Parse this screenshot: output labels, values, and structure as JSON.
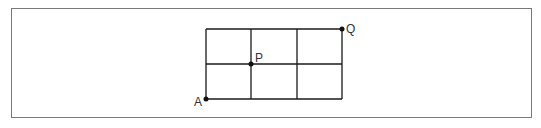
{
  "diagram": {
    "type": "grid-path",
    "grid": {
      "columns": 3,
      "rows": 2,
      "origin": {
        "x": 206,
        "y": 29
      },
      "cell_width": 45.33,
      "cell_height": 35,
      "line_color": "#1a1a1a"
    },
    "points": [
      {
        "id": "A",
        "label": "A",
        "grid_col": 0,
        "grid_row": 2,
        "x": 206,
        "y": 99,
        "label_x": 194,
        "label_y": 106
      },
      {
        "id": "P",
        "label": "P",
        "grid_col": 1,
        "grid_row": 1,
        "x": 251,
        "y": 64,
        "label_x": 255,
        "label_y": 62
      },
      {
        "id": "Q",
        "label": "Q",
        "grid_col": 3,
        "grid_row": 0,
        "x": 342,
        "y": 29,
        "label_x": 346,
        "label_y": 33
      }
    ],
    "frame_color": "#7a7a7a"
  }
}
